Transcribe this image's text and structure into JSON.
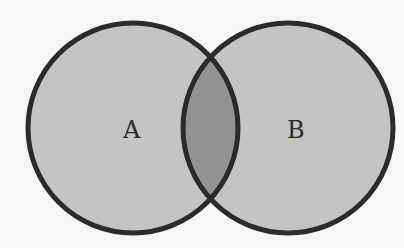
{
  "diagram": {
    "type": "venn",
    "sets": [
      {
        "id": "A",
        "label": "A",
        "cx": 133,
        "cy": 128,
        "r": 105
      },
      {
        "id": "B",
        "label": "B",
        "cx": 288,
        "cy": 128,
        "r": 105
      }
    ],
    "intersection": {
      "label": "",
      "highlighted": true
    },
    "colors": {
      "background": "#f6f6f4",
      "set_fill": "#c4c4c2",
      "intersection_fill": "#8e8e8c",
      "stroke": "#2b2b2b"
    }
  }
}
